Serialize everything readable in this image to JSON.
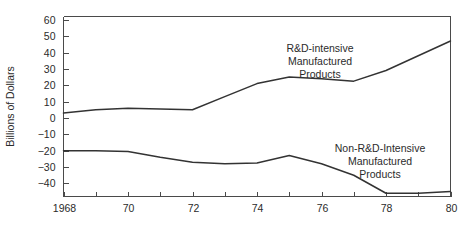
{
  "chart_data": {
    "type": "line",
    "title": "",
    "xlabel": "",
    "ylabel": "Billions of Dollars",
    "xlim": [
      1968,
      1980
    ],
    "ylim": [
      -48,
      62
    ],
    "grid": false,
    "legend": "none",
    "y_ticks": [
      60,
      50,
      40,
      30,
      20,
      10,
      0,
      -10,
      -20,
      -30,
      -40
    ],
    "y_tick_labels": [
      "60",
      "50",
      "40",
      "30",
      "20",
      "10",
      "0",
      "−10",
      "−20",
      "−30",
      "−40"
    ],
    "x_ticks": [
      1968,
      1969,
      1970,
      1971,
      1972,
      1973,
      1974,
      1975,
      1976,
      1977,
      1978,
      1979,
      1980
    ],
    "x_tick_labels": [
      "1968",
      "",
      "70",
      "",
      "72",
      "",
      "74",
      "",
      "76",
      "",
      "78",
      "",
      "80"
    ],
    "x": [
      1968,
      1969,
      1970,
      1971,
      1972,
      1973,
      1974,
      1975,
      1976,
      1977,
      1978,
      1979,
      1980
    ],
    "series": [
      {
        "name": "R&D-intensive Manufactured Products",
        "color": "#333333",
        "values": [
          3,
          5,
          6,
          5.5,
          5,
          13,
          21,
          25,
          24,
          22.5,
          29,
          38,
          47
        ]
      },
      {
        "name": "Non-R&D-Intensive Manufactured Products",
        "color": "#333333",
        "values": [
          -20,
          -20,
          -20.5,
          -24,
          -27,
          -28,
          -27.5,
          -23,
          -28,
          -35,
          -46,
          -46,
          -45
        ]
      }
    ],
    "annotations": [
      {
        "id": "annot-rd-intensive",
        "lines": [
          "R&D-intensive",
          "Manufactured",
          "Products"
        ],
        "x": 320,
        "y": 52
      },
      {
        "id": "annot-non-rd-intensive",
        "lines": [
          "Non-R&D-Intensive",
          "Manufactured",
          "Products"
        ],
        "x": 380,
        "y": 152
      }
    ]
  }
}
